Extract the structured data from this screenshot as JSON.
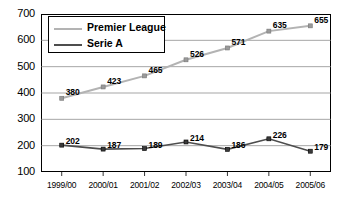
{
  "chart_data": {
    "type": "line",
    "title": "",
    "xlabel": "",
    "ylabel": "",
    "ylim": [
      100,
      700
    ],
    "yticks": [
      "100",
      "200",
      "300",
      "400",
      "500",
      "600",
      "700"
    ],
    "grid": true,
    "legend_position": "top-left-inside",
    "categories": [
      "1999/00",
      "2000/01",
      "2001/02",
      "2002/03",
      "2003/04",
      "2004/05",
      "2005/06"
    ],
    "series": [
      {
        "name": "Premier League",
        "color": "#b3b3b3",
        "values": [
          380,
          423,
          465,
          526,
          571,
          635,
          655
        ],
        "labels": [
          "380",
          "423",
          "465",
          "526",
          "571",
          "635",
          "655"
        ]
      },
      {
        "name": "Serie A",
        "color": "#4d4d4d",
        "values": [
          202,
          187,
          189,
          214,
          186,
          226,
          179
        ],
        "labels": [
          "202",
          "187",
          "189",
          "214",
          "186",
          "226",
          "179"
        ]
      }
    ]
  },
  "legend": {
    "items": [
      {
        "label": "Premier League"
      },
      {
        "label": "Serie A"
      }
    ]
  },
  "colors": {
    "premier_league": "#b3b3b3",
    "serie_a": "#4d4d4d",
    "axis": "#000000",
    "grid": "#808080",
    "background": "#ffffff"
  }
}
